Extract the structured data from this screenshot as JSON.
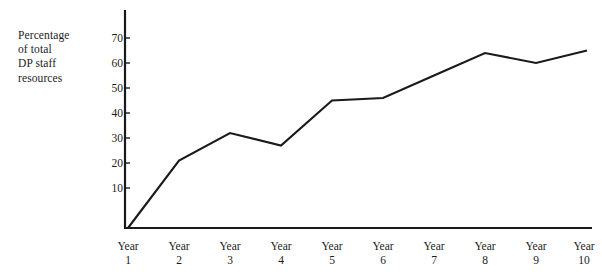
{
  "chart_data": {
    "type": "line",
    "title": "",
    "xlabel": "",
    "ylabel": "Percentage of total DP staff resources",
    "ylabel_lines": [
      "Percentage",
      "of total",
      "DP staff",
      "resources"
    ],
    "categories": [
      "Year 1",
      "Year 2",
      "Year 3",
      "Year 4",
      "Year 5",
      "Year 6",
      "Year 7",
      "Year 8",
      "Year 9",
      "Year 10"
    ],
    "category_lines": [
      {
        "word": "Year",
        "num": "1"
      },
      {
        "word": "Year",
        "num": "2"
      },
      {
        "word": "Year",
        "num": "3"
      },
      {
        "word": "Year",
        "num": "4"
      },
      {
        "word": "Year",
        "num": "5"
      },
      {
        "word": "Year",
        "num": "6"
      },
      {
        "word": "Year",
        "num": "7"
      },
      {
        "word": "Year",
        "num": "8"
      },
      {
        "word": "Year",
        "num": "9"
      },
      {
        "word": "Year",
        "num": "10"
      }
    ],
    "values": [
      0,
      27,
      38,
      33,
      51,
      52,
      61,
      70,
      66,
      71
    ],
    "ylim": [
      0,
      77
    ],
    "yticks": [
      10,
      20,
      30,
      40,
      50,
      60,
      70
    ],
    "ytick_labels": [
      "10",
      "20",
      "30",
      "40",
      "50",
      "60",
      "70"
    ],
    "grid": false,
    "legend": "none",
    "line_color": "#1a1a1a",
    "axis_color": "#1a1a1a",
    "background": "#ffffff"
  }
}
